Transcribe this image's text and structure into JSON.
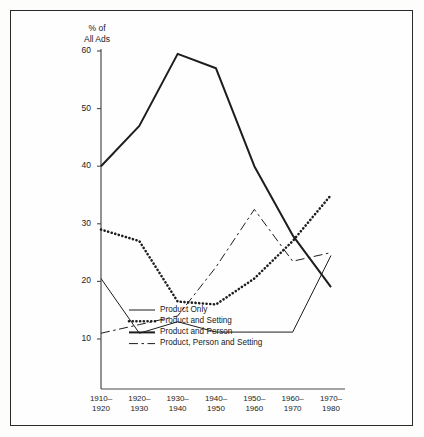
{
  "chart_data": {
    "type": "line",
    "title": "",
    "ylabel": "% of\nAll Ads",
    "xlabel": "",
    "categories": [
      "1910–\n1920",
      "1920–\n1930",
      "1930–\n1940",
      "1940–\n1950",
      "1950–\n1960",
      "1960–\n1970",
      "1970–\n1980"
    ],
    "category_plain": [
      "1910-1920",
      "1920-1930",
      "1930-1940",
      "1940-1950",
      "1950-1960",
      "1960-1970",
      "1970-1980"
    ],
    "ylim": [
      5,
      60
    ],
    "yticks": [
      10,
      20,
      30,
      40,
      50,
      60
    ],
    "ytick_labels": [
      "10",
      "20",
      "30",
      "40",
      "50",
      "60"
    ],
    "grid": false,
    "legend_position": "bottom-center",
    "series": [
      {
        "name": "Product Only",
        "style": "solid-thin",
        "values": [
          20.5,
          11.0,
          13.0,
          11.2,
          11.2,
          11.2,
          24.5
        ]
      },
      {
        "name": "Product and Setting",
        "style": "dotted",
        "values": [
          29.0,
          27.0,
          16.5,
          16.0,
          20.5,
          27.0,
          35.0
        ]
      },
      {
        "name": "Product and Person",
        "style": "solid-thick",
        "values": [
          40.0,
          47.0,
          59.5,
          57.0,
          40.0,
          28.0,
          19.0
        ]
      },
      {
        "name": "Product, Person and Setting",
        "style": "dash-dot",
        "values": [
          11.0,
          12.5,
          14.0,
          22.5,
          32.5,
          23.5,
          25.0
        ]
      }
    ]
  },
  "legend": {
    "items": [
      {
        "label": "Product Only"
      },
      {
        "label": "Product and Setting"
      },
      {
        "label": "Product and Person"
      },
      {
        "label": "Product, Person and Setting"
      }
    ]
  },
  "axes": {
    "y_axis_title": "% of\nAll Ads"
  }
}
